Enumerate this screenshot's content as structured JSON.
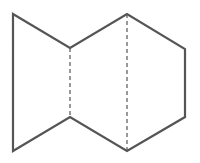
{
  "diagram": {
    "type": "geometric-net",
    "stroke_color": "#555555",
    "background": "#ffffff",
    "outline_points": [
      [
        13,
        14
      ],
      [
        70,
        48
      ],
      [
        127,
        14
      ],
      [
        185,
        49
      ],
      [
        185,
        117
      ],
      [
        127,
        151
      ],
      [
        70,
        117
      ],
      [
        13,
        151
      ]
    ],
    "fold_lines": [
      {
        "x1": 70,
        "y1": 48,
        "x2": 70,
        "y2": 117
      },
      {
        "x1": 127,
        "y1": 14,
        "x2": 127,
        "y2": 151
      }
    ]
  }
}
